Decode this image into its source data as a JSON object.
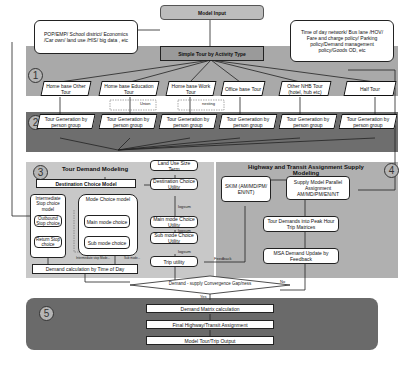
{
  "inputs": {
    "left_note": "POP/EMP/ School district/ Economics /Car own/ land use /HIS/ big data , etc",
    "right_note": "Time of day network/ Bus lane /HOV/ Fare and charge policy/ Parking policy/Demand management policy/Goods OD, etc",
    "model_input": "Model Input",
    "simple_tour": "Simple Tour by Activity Type"
  },
  "stage_numbers": [
    "1",
    "2",
    "3",
    "4",
    "5"
  ],
  "tour_types": [
    "Home base Other Tour",
    "Home base Education Tour",
    "Home base Work Tour",
    "Office base Tour",
    "Other NHB Tour (hotel, hub etc)",
    "Half Tour"
  ],
  "tour_generation_label": "Tour Generation by person group",
  "small_labels": {
    "union": "Union",
    "nesting": "nesting",
    "logsum": "logsum",
    "feedback": "Feedback",
    "yes": "Yes",
    "no": "No",
    "dotted_left": "Intermediate stop Mode...",
    "dotted_right": "Sub mode..."
  },
  "tour_demand": {
    "title": "Tour Demand Modeling",
    "destination_choice": "Destination Choice Model",
    "intermediate_stop": "Intermediate Stop choice model",
    "outbound": "Outbound Stop choice",
    "return": "Return Stop choice",
    "mode_choice": "Mode Choice model",
    "main_mode": "Main mode choice",
    "sub_mode": "Sub mode choice",
    "demand_tod": "Demand calculation by Time of Day"
  },
  "utility_chain": {
    "land_use": "Land Use Size Term",
    "dest_utility": "Destination Choice Utility",
    "main_mode_utility": "Main mode Choice Utility",
    "sub_mode_utility": "Sub mode Choice Utility",
    "trip_utility": "Trip utility"
  },
  "assignment": {
    "title": "Highway and Transit Assignment Supply Modeling",
    "skim": "SKIM (AM/MD/PM/ EN/NT)",
    "parallel": "Supply Model Parallel Assignment AM/MD/PM/EN/NT",
    "peak_hour": "Tour Demands into Peak Hour Trip Matrices",
    "msa": "MSA Demand Update by Feedback"
  },
  "convergence": "Demand - supply Convergence Gap/ness",
  "final": {
    "matrix": "Demand Matrix calculation",
    "assignment": "Final Highway/Transit Assignment",
    "output": "Model Tour/Trip Output"
  },
  "colors": {
    "band1": "#a9a9a9",
    "band2": "#6e6e6e",
    "band3": "#c8c8c8",
    "band4": "#b0b0b0",
    "band5": "#6a6a6a",
    "top_box": "#bdbdbd"
  }
}
